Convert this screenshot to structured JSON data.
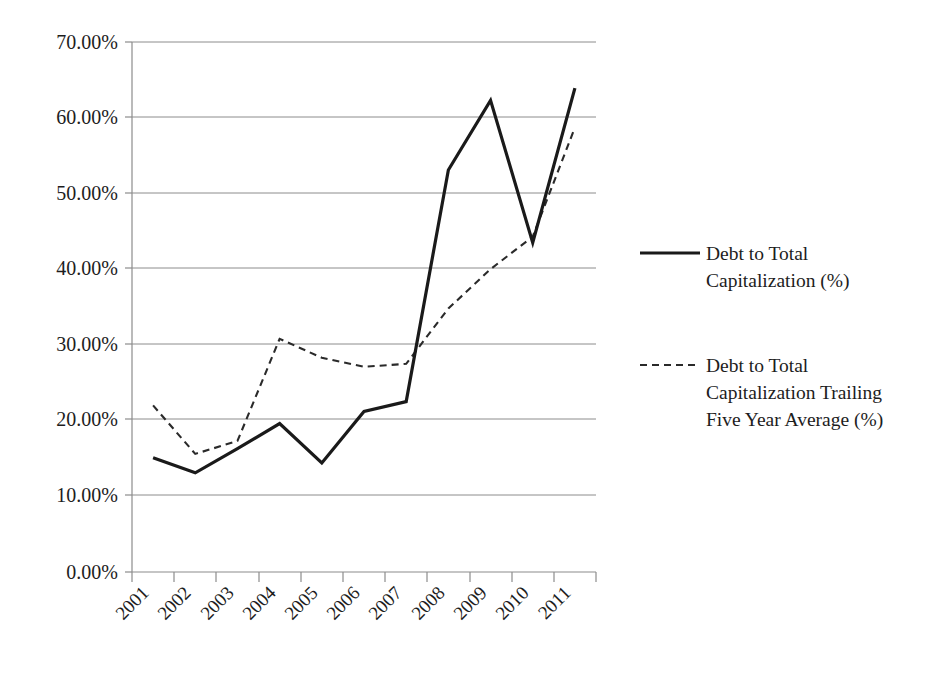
{
  "chart_data": {
    "type": "line",
    "title": "",
    "subtitle": "",
    "xlabel": "",
    "ylabel": "",
    "categories": [
      "2001",
      "2002",
      "2003",
      "2004",
      "2005",
      "2006",
      "2007",
      "2008",
      "2009",
      "2010",
      "2011"
    ],
    "ylim": [
      0,
      70
    ],
    "ytick_values": [
      0,
      10,
      20,
      30,
      40,
      50,
      60,
      70
    ],
    "ytick_labels": [
      "0.00%",
      "10.00%",
      "20.00%",
      "30.00%",
      "40.00%",
      "50.00%",
      "60.00%",
      "70.00%"
    ],
    "grid": true,
    "grid_axis": "y",
    "legend_position": "right",
    "xtick_rotation": 45,
    "series": [
      {
        "name": "Debt to Total Capitalization (%)",
        "style": "solid",
        "color": "#1a1a1a",
        "values": [
          15.1,
          13.1,
          16.3,
          19.6,
          14.4,
          21.2,
          22.5,
          53.1,
          62.3,
          43.5,
          63.9
        ]
      },
      {
        "name": "Debt to Total Capitalization Trailing Five Year Average (%)",
        "style": "dashed",
        "color": "#2a2a2a",
        "values": [
          22.0,
          15.6,
          17.3,
          30.8,
          28.3,
          27.1,
          27.5,
          34.8,
          40.0,
          44.3,
          58.7
        ]
      }
    ]
  },
  "legend": {
    "entries": [
      {
        "line1": "Debt to Total",
        "line2": "Capitalization (%)",
        "line3": ""
      },
      {
        "line1": "Debt to Total",
        "line2": "Capitalization Trailing",
        "line3": "Five Year Average (%)"
      }
    ]
  },
  "axes": {
    "y_labels": [
      "70.00%",
      "60.00%",
      "50.00%",
      "40.00%",
      "30.00%",
      "20.00%",
      "10.00%",
      "0.00%"
    ],
    "x_labels": [
      "2001",
      "2002",
      "2003",
      "2004",
      "2005",
      "2006",
      "2007",
      "2008",
      "2009",
      "2010",
      "2011"
    ]
  }
}
